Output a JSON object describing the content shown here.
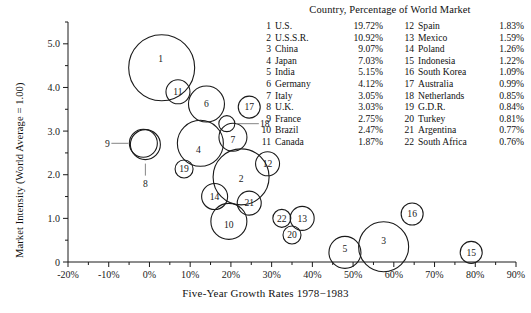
{
  "chart_data": {
    "type": "scatter",
    "title": "Country, Percentage of World Market",
    "xlabel": "Five-Year Growth Rates 1978−1983",
    "ylabel": "Market Intensity (World Average = 1.00)",
    "xlim": [
      -20,
      90
    ],
    "ylim": [
      0,
      5.5
    ],
    "xticks": [
      "-20%",
      "-10%",
      "0%",
      "10%",
      "20%",
      "30%",
      "40%",
      "50%",
      "60%",
      "70%",
      "80%",
      "90%"
    ],
    "xtick_values": [
      -20,
      -10,
      0,
      10,
      20,
      30,
      40,
      50,
      60,
      70,
      80,
      90
    ],
    "yticks": [
      "0",
      "1.0",
      "2.0",
      "3.0",
      "4.0",
      "5.0"
    ],
    "ytick_values": [
      0,
      1,
      2,
      3,
      4,
      5
    ],
    "minor_tick_step_x": 5,
    "minor_tick_step_y": 0.5,
    "grid": false,
    "legend_position": "top-right",
    "bubble_size_encodes": "Percentage of World Market",
    "points": [
      {
        "id": "1",
        "country": "U.S.",
        "pct": 19.72,
        "x": 3.0,
        "y": 4.45,
        "r": 33,
        "label_dx": -1,
        "label_dy": -9,
        "leader": null
      },
      {
        "id": "2",
        "country": "U.S.S.R.",
        "pct": 10.92,
        "x": 22.5,
        "y": 1.95,
        "r": 28,
        "label_dx": 0,
        "label_dy": 2,
        "leader": null
      },
      {
        "id": "3",
        "country": "China",
        "pct": 9.07,
        "x": 57.5,
        "y": 0.35,
        "r": 25,
        "label_dx": 0,
        "label_dy": -6,
        "leader": null
      },
      {
        "id": "4",
        "country": "Japan",
        "pct": 7.03,
        "x": 12.5,
        "y": 2.72,
        "r": 23,
        "label_dx": -2,
        "label_dy": 6,
        "leader": null
      },
      {
        "id": "5",
        "country": "India",
        "pct": 5.15,
        "x": 48.0,
        "y": 0.22,
        "r": 16,
        "label_dx": 0,
        "label_dy": -4,
        "leader": null
      },
      {
        "id": "6",
        "country": "Germany",
        "pct": 4.12,
        "x": 14.0,
        "y": 3.62,
        "r": 18,
        "label_dx": 0,
        "label_dy": 0,
        "leader": null
      },
      {
        "id": "7",
        "country": "Italy",
        "pct": 3.05,
        "x": 20.5,
        "y": 2.86,
        "r": 14,
        "label_dx": 0,
        "label_dy": 2,
        "leader": null
      },
      {
        "id": "8",
        "country": "U.K.",
        "pct": 3.03,
        "x": -1.0,
        "y": 2.69,
        "r": 15,
        "label_dx": 0,
        "label_dy": 0,
        "leader": "down"
      },
      {
        "id": "9",
        "country": "France",
        "pct": 2.75,
        "x": -1.5,
        "y": 2.72,
        "r": 14,
        "label_dx": 0,
        "label_dy": 0,
        "leader": "left"
      },
      {
        "id": "10",
        "country": "Brazil",
        "pct": 2.47,
        "x": 19.5,
        "y": 0.93,
        "r": 18,
        "label_dx": 0,
        "label_dy": 3,
        "leader": null
      },
      {
        "id": "11",
        "country": "Canada",
        "pct": 1.87,
        "x": 7.0,
        "y": 3.9,
        "r": 12,
        "label_dx": 0,
        "label_dy": 0,
        "leader": null
      },
      {
        "id": "12",
        "country": "Spain",
        "pct": 1.83,
        "x": 29.0,
        "y": 2.25,
        "r": 12,
        "label_dx": 0,
        "label_dy": 0,
        "leader": null
      },
      {
        "id": "13",
        "country": "Mexico",
        "pct": 1.59,
        "x": 37.5,
        "y": 1.0,
        "r": 12,
        "label_dx": 0,
        "label_dy": 0,
        "leader": null
      },
      {
        "id": "14",
        "country": "Poland",
        "pct": 1.26,
        "x": 16.0,
        "y": 1.5,
        "r": 13,
        "label_dx": 0,
        "label_dy": 0,
        "leader": null
      },
      {
        "id": "15",
        "country": "Indonesia",
        "pct": 1.22,
        "x": 79.0,
        "y": 0.22,
        "r": 11,
        "label_dx": 0,
        "label_dy": 0,
        "leader": null
      },
      {
        "id": "16",
        "country": "South Korea",
        "pct": 1.09,
        "x": 64.5,
        "y": 1.1,
        "r": 11,
        "label_dx": 0,
        "label_dy": 0,
        "leader": null
      },
      {
        "id": "17",
        "country": "Australia",
        "pct": 0.99,
        "x": 24.5,
        "y": 3.55,
        "r": 11,
        "label_dx": 0,
        "label_dy": 0,
        "leader": null
      },
      {
        "id": "18",
        "country": "Netherlands",
        "pct": 0.85,
        "x": 19.0,
        "y": 3.17,
        "r": 8,
        "label_dx": 0,
        "label_dy": 0,
        "leader": "right"
      },
      {
        "id": "19",
        "country": "G.D.R.",
        "pct": 0.84,
        "x": 8.5,
        "y": 2.13,
        "r": 9,
        "label_dx": 0,
        "label_dy": 0,
        "leader": null
      },
      {
        "id": "20",
        "country": "Turkey",
        "pct": 0.81,
        "x": 35.0,
        "y": 0.62,
        "r": 9,
        "label_dx": 0,
        "label_dy": 0,
        "leader": null
      },
      {
        "id": "21",
        "country": "Argentina",
        "pct": 0.77,
        "x": 24.5,
        "y": 1.35,
        "r": 12,
        "label_dx": 0,
        "label_dy": 0,
        "leader": null
      },
      {
        "id": "22",
        "country": "South Africa",
        "pct": 0.76,
        "x": 32.5,
        "y": 1.0,
        "r": 9,
        "label_dx": 0,
        "label_dy": 0,
        "leader": null
      }
    ]
  },
  "legend": {
    "title": "Country, Percentage of World Market",
    "column1": [
      {
        "num": "1",
        "name": "U.S.",
        "pct": "19.72%"
      },
      {
        "num": "2",
        "name": "U.S.S.R.",
        "pct": "10.92%"
      },
      {
        "num": "3",
        "name": "China",
        "pct": "9.07%"
      },
      {
        "num": "4",
        "name": "Japan",
        "pct": "7.03%"
      },
      {
        "num": "5",
        "name": "India",
        "pct": "5.15%"
      },
      {
        "num": "6",
        "name": "Germany",
        "pct": "4.12%"
      },
      {
        "num": "7",
        "name": "Italy",
        "pct": "3.05%"
      },
      {
        "num": "8",
        "name": "U.K.",
        "pct": "3.03%"
      },
      {
        "num": "9",
        "name": "France",
        "pct": "2.75%"
      },
      {
        "num": "10",
        "name": "Brazil",
        "pct": "2.47%"
      },
      {
        "num": "11",
        "name": "Canada",
        "pct": "1.87%"
      }
    ],
    "column2": [
      {
        "num": "12",
        "name": "Spain",
        "pct": "1.83%"
      },
      {
        "num": "13",
        "name": "Mexico",
        "pct": "1.59%"
      },
      {
        "num": "14",
        "name": "Poland",
        "pct": "1.26%"
      },
      {
        "num": "15",
        "name": "Indonesia",
        "pct": "1.22%"
      },
      {
        "num": "16",
        "name": "South Korea",
        "pct": "1.09%"
      },
      {
        "num": "17",
        "name": "Australia",
        "pct": "0.99%"
      },
      {
        "num": "18",
        "name": "Netherlands",
        "pct": "0.85%"
      },
      {
        "num": "19",
        "name": "G.D.R.",
        "pct": "0.84%"
      },
      {
        "num": "20",
        "name": "Turkey",
        "pct": "0.81%"
      },
      {
        "num": "21",
        "name": "Argentina",
        "pct": "0.77%"
      },
      {
        "num": "22",
        "name": "South Africa",
        "pct": "0.76%"
      }
    ]
  },
  "axes": {
    "x_title": "Five-Year Growth Rates 1978−1983",
    "y_title": "Market Intensity (World Average = 1.00)"
  },
  "colors": {
    "stroke": "#1a1a1a",
    "background": "#ffffff",
    "text": "#111111"
  }
}
